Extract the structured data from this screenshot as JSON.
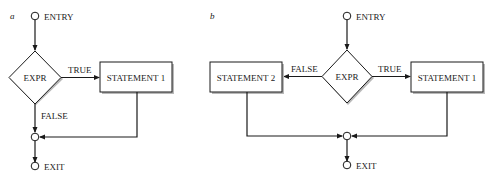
{
  "figure": {
    "panels": [
      {
        "id": "a",
        "label": "a",
        "entry_label": "ENTRY",
        "decision_label": "EXPR",
        "true_label": "TRUE",
        "false_label": "FALSE",
        "statement1_label": "STATEMENT 1",
        "exit_label": "EXIT"
      },
      {
        "id": "b",
        "label": "b",
        "entry_label": "ENTRY",
        "decision_label": "EXPR",
        "true_label": "TRUE",
        "false_label": "FALSE",
        "statement1_label": "STATEMENT 1",
        "statement2_label": "STATEMENT 2",
        "exit_label": "EXIT"
      }
    ]
  }
}
